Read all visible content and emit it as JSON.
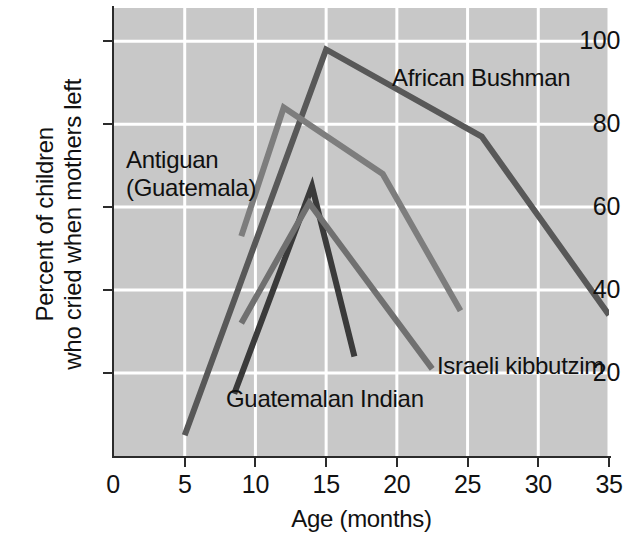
{
  "chart_data": {
    "type": "line",
    "title": "",
    "xlabel": "Age (months)",
    "ylabel": "Percent of children\nwho cried when mothers left",
    "ylabel_lines": [
      "Percent of children",
      "who cried when mothers left"
    ],
    "xlim": [
      0,
      35
    ],
    "ylim": [
      0,
      108
    ],
    "xticks": [
      0,
      5,
      10,
      15,
      20,
      25,
      30,
      35
    ],
    "xtick_labels": [
      "0",
      "5",
      "10",
      "15",
      "20",
      "25",
      "30",
      "35"
    ],
    "yticks": [
      20,
      40,
      60,
      80,
      100
    ],
    "ytick_labels": [
      "20",
      "40",
      "60",
      "80",
      "100"
    ],
    "grid": true,
    "grid_color": "#ffffff",
    "plot_background": "#c8c8c8",
    "legend_position": "inline-annotations",
    "series": [
      {
        "name": "African Bushman",
        "color": "#585858",
        "label_position": "inline",
        "points": [
          [
            5,
            5
          ],
          [
            15,
            98
          ],
          [
            26,
            77
          ],
          [
            35,
            34
          ]
        ]
      },
      {
        "name": "Antiguan (Guatemala)",
        "color": "#7d7d7d",
        "label_position": "inline",
        "points": [
          [
            9,
            53
          ],
          [
            12,
            84
          ],
          [
            19,
            68
          ],
          [
            24.5,
            35
          ]
        ]
      },
      {
        "name": "Guatemalan Indian",
        "color": "#3a3a3a",
        "label_position": "inline",
        "points": [
          [
            8.5,
            15
          ],
          [
            14,
            65
          ],
          [
            17,
            24
          ]
        ]
      },
      {
        "name": "Israeli kibbutzim",
        "color": "#707070",
        "label_position": "inline",
        "points": [
          [
            9,
            32
          ],
          [
            13.8,
            61
          ],
          [
            22.5,
            21
          ]
        ]
      }
    ]
  },
  "annotations": {
    "antiguan": "Antiguan\n(Guatemala)",
    "african_bushman": "African Bushman",
    "guatemalan_indian": "Guatemalan Indian",
    "israeli_kibbutzim": "Israeli kibbutzim"
  },
  "axes": {
    "x_title": "Age (months)",
    "y_title_line1": "Percent of children",
    "y_title_line2": "who cried when mothers left"
  }
}
